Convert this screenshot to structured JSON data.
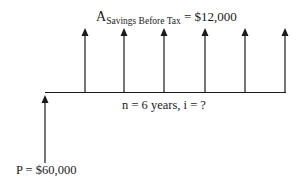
{
  "diagram": {
    "type": "cash-flow-diagram",
    "annuity_label": {
      "symbol": "A",
      "subscript": "Savings Before Tax",
      "value_text": " = $12,000"
    },
    "timeline_label": "n = 6 years, i = ?",
    "present_value_label": "P = $60,000",
    "periods": 6,
    "annuity_amount": 12000,
    "present_value": 60000,
    "colors": {
      "line": "#1a1a1a",
      "background": "#ffffff"
    }
  }
}
